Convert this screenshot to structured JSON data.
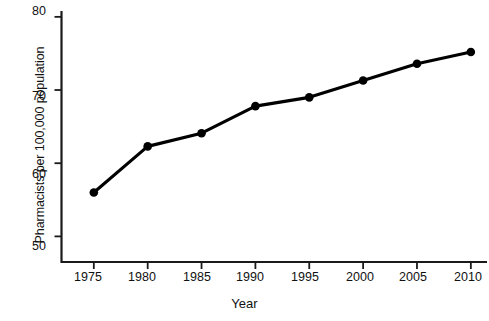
{
  "chart_data": {
    "type": "line",
    "title": "",
    "xlabel": "Year",
    "ylabel": "Pharmacists per 100,000 population",
    "x": [
      1975,
      1980,
      1985,
      1990,
      1995,
      2000,
      2005,
      2010
    ],
    "categories": [
      "1975",
      "1980",
      "1985",
      "1990",
      "1995",
      "2000",
      "2005",
      "2010"
    ],
    "values": [
      56.0,
      62.3,
      64.1,
      67.8,
      69.0,
      71.3,
      73.6,
      75.2
    ],
    "series": [
      {
        "name": "Pharmacists per 100,000 population",
        "values": [
          56.0,
          62.3,
          64.1,
          67.8,
          69.0,
          71.3,
          73.6,
          75.2
        ]
      }
    ],
    "xlim": [
      1972,
      2011.5
    ],
    "ylim": [
      46.5,
      80.8
    ],
    "xticks": [
      1975,
      1980,
      1985,
      1990,
      1995,
      2000,
      2005,
      2010
    ],
    "yticks": [
      50,
      60,
      70,
      80
    ],
    "ytick_labels": [
      "50",
      "60",
      "70",
      "80"
    ],
    "xtick_labels": [
      "1975",
      "1980",
      "1985",
      "1990",
      "1995",
      "2000",
      "2005",
      "2010"
    ],
    "grid": false,
    "legend": false,
    "legend_position": "none",
    "line_color": "#000000",
    "marker": "circle",
    "marker_color": "#000000",
    "background": "#ffffff"
  }
}
